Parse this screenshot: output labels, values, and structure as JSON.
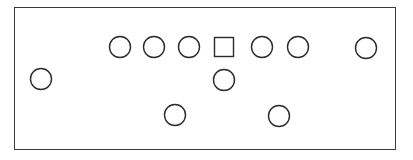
{
  "diagram": {
    "type": "formation-diagram",
    "stroke_color": "#2b2b2b",
    "frame": {
      "x": 14,
      "y": 7,
      "width": 382,
      "height": 143
    },
    "shapes": [
      {
        "id": "player-left",
        "shape": "circle",
        "cx": 41,
        "cy": 79,
        "r": 10.5
      },
      {
        "id": "line-1",
        "shape": "circle",
        "cx": 120,
        "cy": 47,
        "r": 10.5
      },
      {
        "id": "line-2",
        "shape": "circle",
        "cx": 154,
        "cy": 47,
        "r": 10.5
      },
      {
        "id": "line-3",
        "shape": "circle",
        "cx": 189,
        "cy": 47,
        "r": 10.5
      },
      {
        "id": "center",
        "shape": "square",
        "cx": 224,
        "cy": 47,
        "size": 19
      },
      {
        "id": "line-5",
        "shape": "circle",
        "cx": 262,
        "cy": 47,
        "r": 10.5
      },
      {
        "id": "line-6",
        "shape": "circle",
        "cx": 298,
        "cy": 47,
        "r": 10.5
      },
      {
        "id": "player-right",
        "shape": "circle",
        "cx": 366,
        "cy": 48,
        "r": 10.5
      },
      {
        "id": "quarterback",
        "shape": "circle",
        "cx": 224,
        "cy": 80,
        "r": 10.5
      },
      {
        "id": "back-left",
        "shape": "circle",
        "cx": 175,
        "cy": 115,
        "r": 10.5
      },
      {
        "id": "back-right",
        "shape": "circle",
        "cx": 279,
        "cy": 116,
        "r": 10.5
      }
    ]
  }
}
